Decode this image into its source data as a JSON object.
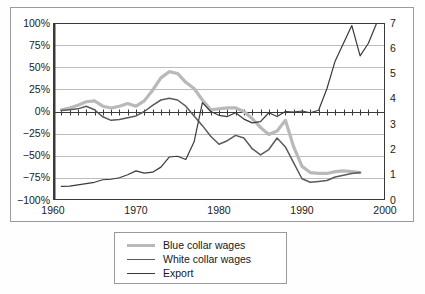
{
  "chart_data": {
    "type": "line",
    "title": "",
    "subtitle": "",
    "xlabel": "",
    "ylabel": "",
    "grid": true,
    "legend_position": "bottom-center",
    "x": [
      1961,
      1962,
      1963,
      1964,
      1965,
      1966,
      1967,
      1968,
      1969,
      1970,
      1971,
      1972,
      1973,
      1974,
      1975,
      1976,
      1977,
      1978,
      1979,
      1980,
      1981,
      1982,
      1983,
      1984,
      1985,
      1986,
      1987,
      1988,
      1989,
      1990,
      1991,
      1992,
      1993,
      1994,
      1995,
      1996,
      1997,
      1998,
      1999
    ],
    "x_ticks": [
      1960,
      1970,
      1980,
      1990,
      2000
    ],
    "xlim": [
      1960,
      2000
    ],
    "axes": [
      {
        "id": "left",
        "side": "left",
        "ticks": [
          "100%",
          "75%",
          "50%",
          "25%",
          "0%",
          "-25%",
          "-50%",
          "-75%",
          "-100%"
        ],
        "tick_values": [
          100,
          75,
          50,
          25,
          0,
          -25,
          -50,
          -75,
          -100
        ],
        "ylim": [
          -100,
          100
        ],
        "unit": "percent"
      },
      {
        "id": "right",
        "side": "right",
        "ticks": [
          "7",
          "6",
          "5",
          "4",
          "3",
          "2",
          "1",
          "0"
        ],
        "tick_values": [
          7,
          6,
          5,
          4,
          3,
          2,
          1,
          0
        ],
        "ylim": [
          0,
          7
        ],
        "unit": "index"
      }
    ],
    "series": [
      {
        "name": "Blue collar wages",
        "axis": "left",
        "color": "#b9b9b9",
        "width": 3.2,
        "unit": "percent",
        "values": [
          2,
          4,
          7,
          11,
          12,
          6,
          4,
          6,
          9,
          6,
          12,
          24,
          38,
          45,
          43,
          33,
          26,
          13,
          2,
          3,
          4,
          4,
          0,
          -8,
          -18,
          -26,
          -22,
          -10,
          -40,
          -62,
          -69,
          -70,
          -70,
          -68,
          -67,
          -68,
          -69,
          null,
          null
        ]
      },
      {
        "name": "White collar wages",
        "axis": "left",
        "color": "#5a5a5a",
        "width": 1.5,
        "unit": "percent",
        "values": [
          1,
          2,
          3,
          6,
          2,
          -6,
          -10,
          -9,
          -7,
          -5,
          0,
          7,
          13,
          15,
          13,
          6,
          -5,
          -16,
          -28,
          -37,
          -33,
          -27,
          -30,
          -42,
          -49,
          -43,
          -30,
          -40,
          -58,
          -76,
          -80,
          -79,
          -78,
          -74,
          -72,
          -70,
          -69,
          null,
          null
        ]
      },
      {
        "name": "Export",
        "axis": "right",
        "color": "#3a3a3a",
        "width": 1.2,
        "unit": "index",
        "values": [
          0.54,
          0.55,
          0.6,
          0.65,
          0.7,
          0.8,
          0.82,
          0.88,
          1.0,
          1.15,
          1.06,
          1.1,
          1.3,
          1.7,
          1.73,
          1.6,
          2.3,
          3.85,
          3.5,
          3.35,
          3.3,
          3.45,
          3.2,
          3.05,
          3.1,
          3.45,
          3.3,
          3.5,
          3.48,
          3.52,
          3.45,
          3.55,
          4.4,
          5.5,
          6.2,
          6.9,
          5.7,
          6.2,
          7.0
        ]
      }
    ]
  },
  "legend": {
    "items": [
      {
        "label": "Blue collar wages",
        "color": "#b9b9b9",
        "width": 3.2
      },
      {
        "label": "White collar wages",
        "color": "#5a5a5a",
        "width": 1.6
      },
      {
        "label": "Export",
        "color": "#3a3a3a",
        "width": 1.1
      }
    ]
  },
  "colors": {
    "frame": "#9a9a9a",
    "axis": "#3a3a3a",
    "grid": "#bdbdbd",
    "background": "#ffffff",
    "text": "#1b1b1b"
  }
}
